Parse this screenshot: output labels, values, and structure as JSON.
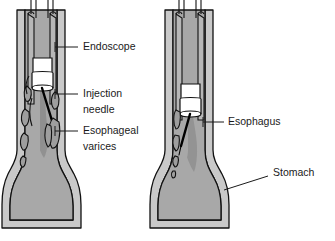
{
  "figure": {
    "background_color": "#ffffff",
    "width": 335,
    "height": 241
  },
  "colors": {
    "outline": "#111111",
    "tissue_fill": "#a8a8a8",
    "wall_fill": "#c9c9c9",
    "scope_shaft_fill": "#b5b5b5",
    "scope_tip_fill": "#ffffff",
    "varix_fill": "#9a9a9a",
    "injectate_fill": "#8c8c8c",
    "text": "#1a1a1a",
    "leader": "#1a1a1a"
  },
  "panels": [
    {
      "id": "left-panel",
      "name": "variceal-injection-panel",
      "labels": [
        {
          "id": "endoscope",
          "text": "Endoscope",
          "lines": [
            "Endoscope"
          ],
          "text_x": 83,
          "text_y": 47,
          "leader": {
            "x1": 55,
            "y1": 47,
            "x2": 78,
            "y2": 47
          },
          "pointer": {
            "x1": 55,
            "y1": 42,
            "x2": 55,
            "y2": 52
          }
        },
        {
          "id": "injection-needle",
          "text": "Injection needle",
          "lines": [
            "Injection",
            "needle"
          ],
          "text_x": 83,
          "text_y": 94,
          "leader": {
            "x1": 55,
            "y1": 94,
            "x2": 78,
            "y2": 94
          },
          "pointer": {
            "x1": 55,
            "y1": 89,
            "x2": 55,
            "y2": 99
          }
        },
        {
          "id": "esophageal-varices",
          "text": "Esophageal varices",
          "lines": [
            "Esophageal",
            "varices"
          ],
          "text_x": 83,
          "text_y": 131,
          "leader": {
            "x1": 55,
            "y1": 131,
            "x2": 78,
            "y2": 131
          },
          "pointer": {
            "x1": 55,
            "y1": 126,
            "x2": 55,
            "y2": 136
          }
        }
      ]
    },
    {
      "id": "right-panel",
      "name": "normal-anatomy-panel",
      "labels": [
        {
          "id": "esophagus",
          "text": "Esophagus",
          "lines": [
            "Esophagus"
          ],
          "text_x": 228,
          "text_y": 122,
          "leader": {
            "x1": 203,
            "y1": 122,
            "x2": 224,
            "y2": 122
          },
          "pointer": {
            "x1": 203,
            "y1": 117,
            "x2": 203,
            "y2": 127
          }
        },
        {
          "id": "stomach",
          "text": "Stomach",
          "lines": [
            "Stomach"
          ],
          "text_x": 273,
          "text_y": 173,
          "leader_path": "M 268 176 L 224 190"
        }
      ]
    }
  ],
  "anatomy": {
    "left": {
      "esophagus_label": "Esophagus",
      "stomach_label": "Stomach",
      "varices_count": 9,
      "scope_present": true,
      "needle_present": true
    },
    "right": {
      "esophagus_label": "Esophagus",
      "stomach_label": "Stomach",
      "varices_count": 4,
      "scope_present": true,
      "needle_present": true
    }
  }
}
